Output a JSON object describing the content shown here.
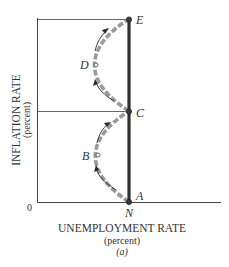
{
  "diagram": {
    "panel_label": "(a)",
    "x_axis": {
      "title": "UNEMPLOYMENT RATE",
      "unit": "(percent)",
      "origin_label": "0",
      "tick_label": "N"
    },
    "y_axis": {
      "title": "INFLATION RATE",
      "unit": "(percent)"
    },
    "points": {
      "A": "A",
      "B": "B",
      "C": "C",
      "D": "D",
      "E": "E"
    },
    "colors": {
      "long_run_line": "#2f2f2f",
      "adjustment_path": "#9a9a9a",
      "axes": "#444444"
    }
  }
}
